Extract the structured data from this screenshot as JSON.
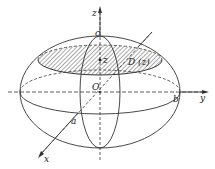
{
  "diagram": {
    "type": "ellipsoid-cross-section",
    "labels": {
      "z_axis": "z",
      "y_axis": "y",
      "x_axis": "x",
      "origin": "O",
      "top_intercept": "c",
      "y_intercept": "b",
      "x_intercept": "a",
      "section_point": "z",
      "section_region": "D (z)"
    },
    "colors": {
      "stroke": "#333333",
      "hatch": "#555555",
      "background": "#ffffff"
    }
  }
}
